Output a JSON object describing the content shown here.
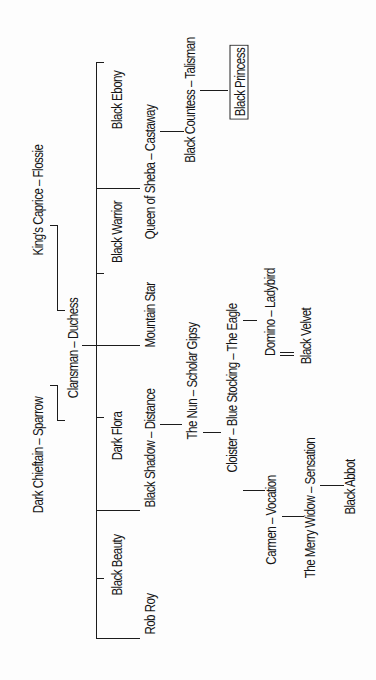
{
  "diagram": {
    "type": "pedigree-tree",
    "orientation": "rotated-90-ccw",
    "root_couple": {
      "label": "Clansman – Duchess",
      "sire": "Clansman",
      "dam": "Duchess",
      "sire_parents": "Dark Chieftain – Sparrow",
      "dam_parents": "King's Caprice – Flossie"
    },
    "labels": {
      "dark_chieftain_sparrow": "Dark Chieftain – Sparrow",
      "kings_caprice_flossie": "King's Caprice – Flossie",
      "clansman_duchess": "Clansman – Duchess",
      "black_ebony": "Black Ebony",
      "black_warrior": "Black Warrior",
      "dark_flora": "Dark Flora",
      "black_beauty": "Black Beauty",
      "queen_of_sheba_castaway": "Queen of Sheba – Castaway",
      "mountain_star": "Mountain Star",
      "black_shadow_distance": "Black Shadow – Distance",
      "rob_roy": "Rob Roy",
      "black_countess_talisman": "Black Countess – Talisman",
      "black_princess": "Black Princess",
      "the_nun_scholar_gipsy": "The Nun – Scholar Gipsy",
      "cloister_blue_stocking_the_eagle": "Cloister – Blue Stocking – The Eagle",
      "domino_ladybird": "Domino – Ladybird",
      "black_velvet": "Black Velvet",
      "carmen_vocation": "Carmen – Vocation",
      "the_merry_widow_sensation": "The Merry Widow – Sensation",
      "black_abbot": "Black Abbot"
    },
    "children_of_root": [
      "Black Ebony",
      "Queen of Sheba",
      "Black Warrior",
      "Mountain Star",
      "Dark Flora",
      "Black Shadow",
      "Black Beauty",
      "Rob Roy"
    ],
    "highlighted": "Black Princess",
    "colors": {
      "ink": "#151515",
      "background": "#fdfdfd"
    }
  }
}
